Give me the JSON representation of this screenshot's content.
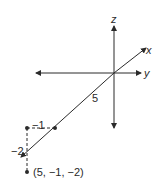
{
  "diagram": {
    "type": "3d-coordinate-plot",
    "axes": {
      "z_label": "z",
      "x_label": "x",
      "y_label": "y"
    },
    "distance_label": "5",
    "y_offset_label": "−1",
    "z_offset_label": "−2",
    "point_label": "(5, −1, −2)",
    "point": {
      "x": 5,
      "y": -1,
      "z": -2
    },
    "colors": {
      "line": "#2a2a2a",
      "background": "#ffffff"
    }
  }
}
